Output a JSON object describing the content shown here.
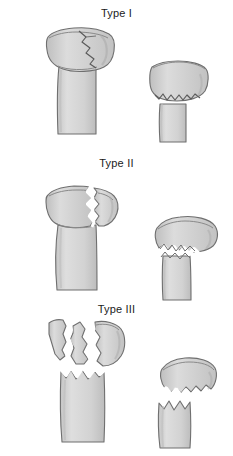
{
  "figure": {
    "title_visible": false,
    "background_color": "#ffffff",
    "bone_fill": "#d6d6d6",
    "bone_fill_light": "#e2e2e2",
    "bone_shade": "#b9b9b9",
    "bone_outline": "#6f6f6f",
    "crack_color": "#5a5a5a",
    "gap_color": "#ffffff",
    "label_color": "#1b1b1b"
  },
  "panels": [
    {
      "label": "Type I",
      "id": "type-1",
      "views": [
        {
          "id": "type-1-frontal",
          "name": "frontal-view",
          "fracture": "non-displaced crack"
        },
        {
          "id": "type-1-lateral",
          "name": "lateral-view",
          "fracture": "non-displaced crack"
        }
      ]
    },
    {
      "label": "Type II",
      "id": "type-2",
      "views": [
        {
          "id": "type-2-frontal",
          "name": "frontal-view",
          "fracture": "displaced fragment"
        },
        {
          "id": "type-2-lateral",
          "name": "lateral-view",
          "fracture": "displaced fragment"
        }
      ]
    },
    {
      "label": "Type III",
      "id": "type-3",
      "views": [
        {
          "id": "type-3-frontal",
          "name": "frontal-view",
          "fracture": "comminuted multi-fragment"
        },
        {
          "id": "type-3-lateral",
          "name": "lateral-view",
          "fracture": "comminuted separated"
        }
      ]
    }
  ]
}
